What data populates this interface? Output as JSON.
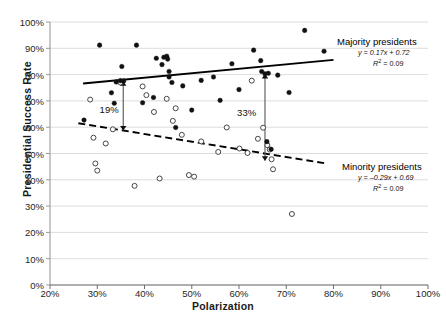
{
  "chart_data": {
    "type": "scatter",
    "title": "",
    "xlabel": "Polarization",
    "ylabel": "Presidential Success Rate",
    "xlim": [
      0.2,
      1.0
    ],
    "ylim": [
      0.0,
      1.0
    ],
    "xticks": [
      "20%",
      "30%",
      "40%",
      "50%",
      "60%",
      "70%",
      "80%",
      "90%",
      "100%"
    ],
    "yticks": [
      "0%",
      "10%",
      "20%",
      "30%",
      "40%",
      "50%",
      "60%",
      "70%",
      "80%",
      "90%",
      "100%"
    ],
    "grid": "horizontal",
    "legend_position": "inline-right",
    "series": [
      {
        "name": "Majority presidents",
        "marker": "filled-circle",
        "color": "#111111",
        "points": [
          [
            0.272,
            0.627
          ],
          [
            0.305,
            0.912
          ],
          [
            0.33,
            0.731
          ],
          [
            0.336,
            0.691
          ],
          [
            0.34,
            0.772
          ],
          [
            0.349,
            0.777
          ],
          [
            0.352,
            0.831
          ],
          [
            0.356,
            0.776
          ],
          [
            0.383,
            0.912
          ],
          [
            0.396,
            0.693
          ],
          [
            0.419,
            0.713
          ],
          [
            0.425,
            0.862
          ],
          [
            0.437,
            0.838
          ],
          [
            0.441,
            0.866
          ],
          [
            0.447,
            0.87
          ],
          [
            0.449,
            0.859
          ],
          [
            0.452,
            0.812
          ],
          [
            0.452,
            0.791
          ],
          [
            0.458,
            0.77
          ],
          [
            0.466,
            0.599
          ],
          [
            0.481,
            0.757
          ],
          [
            0.5,
            0.665
          ],
          [
            0.52,
            0.778
          ],
          [
            0.546,
            0.791
          ],
          [
            0.56,
            0.702
          ],
          [
            0.585,
            0.841
          ],
          [
            0.6,
            0.743
          ],
          [
            0.631,
            0.893
          ],
          [
            0.646,
            0.853
          ],
          [
            0.648,
            0.812
          ],
          [
            0.655,
            0.803
          ],
          [
            0.659,
            0.545
          ],
          [
            0.662,
            0.805
          ],
          [
            0.668,
            0.516
          ],
          [
            0.682,
            0.798
          ],
          [
            0.706,
            0.732
          ],
          [
            0.739,
            0.968
          ],
          [
            0.78,
            0.889
          ]
        ]
      },
      {
        "name": "Minority presidents",
        "marker": "open-circle",
        "color": "#111111",
        "points": [
          [
            0.285,
            0.705
          ],
          [
            0.292,
            0.56
          ],
          [
            0.296,
            0.462
          ],
          [
            0.3,
            0.435
          ],
          [
            0.318,
            0.538
          ],
          [
            0.333,
            0.592
          ],
          [
            0.349,
            0.77
          ],
          [
            0.379,
            0.377
          ],
          [
            0.396,
            0.755
          ],
          [
            0.404,
            0.722
          ],
          [
            0.42,
            0.658
          ],
          [
            0.432,
            0.405
          ],
          [
            0.447,
            0.708
          ],
          [
            0.46,
            0.624
          ],
          [
            0.466,
            0.672
          ],
          [
            0.479,
            0.571
          ],
          [
            0.494,
            0.418
          ],
          [
            0.505,
            0.412
          ],
          [
            0.52,
            0.546
          ],
          [
            0.556,
            0.506
          ],
          [
            0.574,
            0.599
          ],
          [
            0.601,
            0.519
          ],
          [
            0.618,
            0.502
          ],
          [
            0.627,
            0.777
          ],
          [
            0.64,
            0.556
          ],
          [
            0.651,
            0.598
          ],
          [
            0.66,
            0.532
          ],
          [
            0.665,
            0.515
          ],
          [
            0.669,
            0.478
          ],
          [
            0.672,
            0.44
          ],
          [
            0.712,
            0.27
          ]
        ]
      }
    ],
    "trendlines": [
      {
        "name": "Majority presidents",
        "style": "solid",
        "label": "Majority presidents",
        "equation": "y = 0.17x + 0.72",
        "r2_label": "R",
        "r2_exp": "2",
        "r2_value": " = 0.09",
        "x_from": 0.27,
        "x_to": 0.8,
        "y_from": 0.766,
        "y_to": 0.856
      },
      {
        "name": "Minority presidents",
        "style": "dashed",
        "label": "Minority presidents",
        "equation": "y = –0.29x + 0.69",
        "r2_label": "R",
        "r2_exp": "2",
        "r2_value": " = 0.09",
        "x_from": 0.26,
        "x_to": 0.785,
        "y_from": 0.615,
        "y_to": 0.462
      }
    ],
    "annotations": [
      {
        "text": "19%",
        "x": 0.355,
        "y_top": 0.775,
        "y_bottom": 0.587,
        "label_x": 0.305,
        "label_y": 0.665
      },
      {
        "text": "33%",
        "x": 0.655,
        "y_top": 0.803,
        "y_bottom": 0.472,
        "label_x": 0.596,
        "label_y": 0.655
      }
    ]
  }
}
